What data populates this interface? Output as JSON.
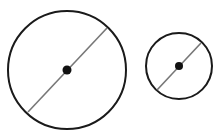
{
  "diagram": {
    "background": "#ffffff",
    "circles": [
      {
        "label": "large-circle",
        "cx": 67,
        "cy": 70,
        "r": 59,
        "stroke": "#1a1a1a",
        "stroke_width": 2,
        "diameter": {
          "x1": 28,
          "y1": 112,
          "x2": 107,
          "y2": 28,
          "stroke": "#777777",
          "stroke_width": 1.6
        },
        "center_dot": {
          "r": 4.5,
          "fill": "#111111"
        }
      },
      {
        "label": "small-circle",
        "cx": 179,
        "cy": 66,
        "r": 33,
        "stroke": "#1a1a1a",
        "stroke_width": 2,
        "diameter": {
          "x1": 157,
          "y1": 90,
          "x2": 201,
          "y2": 43,
          "stroke": "#777777",
          "stroke_width": 1.6
        },
        "center_dot": {
          "r": 4,
          "fill": "#111111"
        }
      }
    ]
  }
}
